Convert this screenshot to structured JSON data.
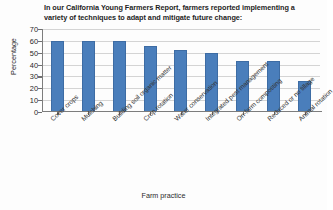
{
  "chart_data": {
    "type": "bar",
    "title": "In our California Young Farmers Report, farmers reported implementing a variety of techniques to adapt and mitigate future change:",
    "xlabel": "Farm practice",
    "ylabel": "Percentage",
    "categories": [
      "Cover crops",
      "Mulching",
      "Building soil organic matter",
      "Crop rotation",
      "Water conservation",
      "Integrated pest management",
      "On-farm composting",
      "Reduced or no tillage",
      "Animal rotation"
    ],
    "values": [
      60,
      60,
      60,
      56,
      52,
      50,
      43,
      43,
      26
    ],
    "ylim": [
      0,
      70
    ],
    "ytick_labels": [
      "0",
      "10",
      "20",
      "30",
      "40",
      "50",
      "60",
      "70"
    ],
    "ytick_values": [
      0,
      10,
      20,
      30,
      40,
      50,
      60,
      70
    ],
    "grid": true,
    "legend": false,
    "series_color": "#4a7ebb",
    "grid_color": "#d4d4d4",
    "axis_color": "#7d7d7d"
  }
}
